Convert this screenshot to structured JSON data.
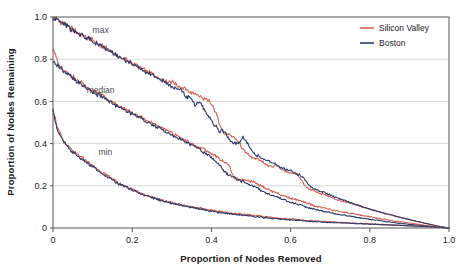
{
  "chart_data": {
    "type": "line",
    "title": "",
    "subtitle": "",
    "xlabel": "Proportion of Nodes Removed",
    "ylabel": "Proportion of Nodes Remaining",
    "xlim": [
      0,
      1
    ],
    "ylim": [
      0,
      1
    ],
    "grid": "horizontal",
    "xticks": [
      "0",
      "0.2",
      "0.4",
      "0.6",
      "0.8",
      "1.0"
    ],
    "xtick_values": [
      0,
      0.2,
      0.4,
      0.6,
      0.8,
      1
    ],
    "yticks": [
      "0",
      "0.2",
      "0.4",
      "0.6",
      "0.8",
      "1.0"
    ],
    "ytick_values": [
      0,
      0.2,
      0.4,
      0.6,
      0.8,
      1
    ],
    "legend_position": "top-right",
    "legend": [
      {
        "name": "Silicon Valley",
        "color": "#d5604e"
      },
      {
        "name": "Boston",
        "color": "#2c3b6b"
      }
    ],
    "annotations": [
      {
        "text": "max",
        "x": 0.1,
        "y": 0.925
      },
      {
        "text": "median",
        "x": 0.085,
        "y": 0.64
      },
      {
        "text": "min",
        "x": 0.115,
        "y": 0.345
      }
    ],
    "series": [
      {
        "name": "Silicon Valley max",
        "group": "max",
        "color": "#d5604e",
        "x": [
          0,
          0.012,
          0.024,
          0.036,
          0.048,
          0.06,
          0.072,
          0.084,
          0.096,
          0.108,
          0.12,
          0.132,
          0.144,
          0.156,
          0.168,
          0.18,
          0.192,
          0.204,
          0.216,
          0.228,
          0.24,
          0.252,
          0.264,
          0.276,
          0.288,
          0.3,
          0.312,
          0.324,
          0.336,
          0.348,
          0.36,
          0.372,
          0.384,
          0.396,
          0.408,
          0.42,
          0.432,
          0.444,
          0.456,
          0.468,
          0.48,
          0.492,
          0.504,
          0.516,
          0.528,
          0.54,
          0.552,
          0.564,
          0.576,
          0.588,
          0.6,
          0.612,
          0.624,
          0.636,
          0.648,
          0.66,
          0.672,
          0.684,
          0.696,
          0.708,
          0.72,
          0.732,
          0.744,
          0.756,
          0.768,
          0.78,
          0.792,
          0.804,
          0.816,
          0.828,
          0.84,
          0.852,
          0.864,
          0.876,
          0.888,
          0.9,
          0.912,
          0.924,
          0.936,
          0.948,
          0.96,
          0.972,
          0.984,
          1
        ],
        "y": [
          1,
          0.985,
          0.972,
          0.958,
          0.944,
          0.931,
          0.918,
          0.903,
          0.892,
          0.878,
          0.864,
          0.851,
          0.838,
          0.826,
          0.811,
          0.8,
          0.788,
          0.775,
          0.762,
          0.75,
          0.74,
          0.728,
          0.716,
          0.704,
          0.69,
          0.695,
          0.676,
          0.667,
          0.655,
          0.64,
          0.64,
          0.622,
          0.61,
          0.6,
          0.56,
          0.5,
          0.45,
          0.44,
          0.43,
          0.41,
          0.37,
          0.35,
          0.335,
          0.33,
          0.315,
          0.3,
          0.29,
          0.3,
          0.28,
          0.27,
          0.26,
          0.26,
          0.24,
          0.2,
          0.185,
          0.175,
          0.165,
          0.16,
          0.15,
          0.14,
          0.133,
          0.126,
          0.12,
          0.115,
          0.108,
          0.1,
          0.093,
          0.087,
          0.08,
          0.074,
          0.068,
          0.062,
          0.056,
          0.05,
          0.045,
          0.04,
          0.034,
          0.029,
          0.024,
          0.019,
          0.014,
          0.009,
          0.005,
          0
        ]
      },
      {
        "name": "Boston max",
        "group": "max",
        "color": "#2c3b6b",
        "x": [
          0,
          0.012,
          0.024,
          0.036,
          0.048,
          0.06,
          0.072,
          0.084,
          0.096,
          0.108,
          0.12,
          0.132,
          0.144,
          0.156,
          0.168,
          0.18,
          0.192,
          0.204,
          0.216,
          0.228,
          0.24,
          0.252,
          0.264,
          0.276,
          0.288,
          0.3,
          0.312,
          0.324,
          0.336,
          0.348,
          0.36,
          0.372,
          0.384,
          0.396,
          0.408,
          0.42,
          0.432,
          0.444,
          0.456,
          0.468,
          0.48,
          0.492,
          0.504,
          0.516,
          0.528,
          0.54,
          0.552,
          0.564,
          0.576,
          0.588,
          0.6,
          0.612,
          0.624,
          0.636,
          0.648,
          0.66,
          0.672,
          0.684,
          0.696,
          0.708,
          0.72,
          0.732,
          0.744,
          0.756,
          0.768,
          0.78,
          0.792,
          0.804,
          0.816,
          0.828,
          0.84,
          0.852,
          0.864,
          0.876,
          0.888,
          0.9,
          0.912,
          0.924,
          0.936,
          0.948,
          0.96,
          0.972,
          0.984,
          1
        ],
        "y": [
          0.995,
          0.982,
          0.969,
          0.955,
          0.942,
          0.928,
          0.915,
          0.9,
          0.888,
          0.875,
          0.861,
          0.848,
          0.835,
          0.823,
          0.808,
          0.797,
          0.785,
          0.772,
          0.76,
          0.747,
          0.736,
          0.724,
          0.712,
          0.7,
          0.686,
          0.67,
          0.66,
          0.655,
          0.62,
          0.615,
          0.58,
          0.6,
          0.555,
          0.52,
          0.49,
          0.46,
          0.46,
          0.42,
          0.4,
          0.4,
          0.43,
          0.4,
          0.36,
          0.345,
          0.33,
          0.32,
          0.31,
          0.3,
          0.285,
          0.275,
          0.27,
          0.255,
          0.25,
          0.23,
          0.2,
          0.185,
          0.175,
          0.17,
          0.16,
          0.15,
          0.14,
          0.132,
          0.125,
          0.118,
          0.11,
          0.102,
          0.095,
          0.088,
          0.081,
          0.075,
          0.069,
          0.063,
          0.057,
          0.051,
          0.046,
          0.04,
          0.035,
          0.03,
          0.024,
          0.019,
          0.014,
          0.009,
          0.005,
          0
        ]
      },
      {
        "name": "Silicon Valley median",
        "group": "median",
        "color": "#d5604e",
        "x": [
          0,
          0.012,
          0.024,
          0.036,
          0.048,
          0.06,
          0.072,
          0.084,
          0.096,
          0.108,
          0.12,
          0.132,
          0.144,
          0.156,
          0.168,
          0.18,
          0.192,
          0.204,
          0.216,
          0.228,
          0.24,
          0.252,
          0.264,
          0.276,
          0.288,
          0.3,
          0.312,
          0.324,
          0.336,
          0.348,
          0.36,
          0.372,
          0.384,
          0.396,
          0.408,
          0.42,
          0.432,
          0.444,
          0.456,
          0.468,
          0.48,
          0.492,
          0.504,
          0.516,
          0.528,
          0.54,
          0.552,
          0.564,
          0.576,
          0.588,
          0.6,
          0.612,
          0.624,
          0.636,
          0.648,
          0.66,
          0.672,
          0.684,
          0.696,
          0.708,
          0.72,
          0.732,
          0.744,
          0.756,
          0.768,
          0.78,
          0.792,
          0.804,
          0.816,
          0.828,
          0.84,
          0.852,
          0.864,
          0.876,
          0.888,
          0.9,
          0.912,
          0.924,
          0.936,
          0.948,
          0.96,
          0.972,
          0.984,
          1
        ],
        "y": [
          0.855,
          0.78,
          0.755,
          0.74,
          0.718,
          0.7,
          0.69,
          0.672,
          0.655,
          0.645,
          0.63,
          0.62,
          0.6,
          0.59,
          0.575,
          0.565,
          0.552,
          0.54,
          0.532,
          0.52,
          0.505,
          0.495,
          0.48,
          0.47,
          0.46,
          0.45,
          0.44,
          0.425,
          0.415,
          0.4,
          0.39,
          0.38,
          0.37,
          0.355,
          0.345,
          0.33,
          0.315,
          0.3,
          0.24,
          0.23,
          0.23,
          0.225,
          0.22,
          0.21,
          0.2,
          0.185,
          0.175,
          0.17,
          0.155,
          0.15,
          0.14,
          0.135,
          0.13,
          0.12,
          0.115,
          0.105,
          0.1,
          0.095,
          0.09,
          0.085,
          0.08,
          0.075,
          0.072,
          0.068,
          0.064,
          0.06,
          0.056,
          0.052,
          0.048,
          0.044,
          0.04,
          0.036,
          0.033,
          0.03,
          0.027,
          0.024,
          0.02,
          0.017,
          0.014,
          0.011,
          0.008,
          0.005,
          0.003,
          0
        ]
      },
      {
        "name": "Boston median",
        "group": "median",
        "color": "#2c3b6b",
        "x": [
          0,
          0.012,
          0.024,
          0.036,
          0.048,
          0.06,
          0.072,
          0.084,
          0.096,
          0.108,
          0.12,
          0.132,
          0.144,
          0.156,
          0.168,
          0.18,
          0.192,
          0.204,
          0.216,
          0.228,
          0.24,
          0.252,
          0.264,
          0.276,
          0.288,
          0.3,
          0.312,
          0.324,
          0.336,
          0.348,
          0.36,
          0.372,
          0.384,
          0.396,
          0.408,
          0.42,
          0.432,
          0.444,
          0.456,
          0.468,
          0.48,
          0.492,
          0.504,
          0.516,
          0.528,
          0.54,
          0.552,
          0.564,
          0.576,
          0.588,
          0.6,
          0.612,
          0.624,
          0.636,
          0.648,
          0.66,
          0.672,
          0.684,
          0.696,
          0.708,
          0.72,
          0.732,
          0.744,
          0.756,
          0.768,
          0.78,
          0.792,
          0.804,
          0.816,
          0.828,
          0.84,
          0.852,
          0.864,
          0.876,
          0.888,
          0.9,
          0.912,
          0.924,
          0.936,
          0.948,
          0.96,
          0.972,
          0.984,
          1
        ],
        "y": [
          0.79,
          0.77,
          0.75,
          0.73,
          0.712,
          0.695,
          0.68,
          0.665,
          0.65,
          0.638,
          0.625,
          0.612,
          0.598,
          0.585,
          0.572,
          0.56,
          0.548,
          0.538,
          0.525,
          0.512,
          0.5,
          0.49,
          0.478,
          0.465,
          0.452,
          0.44,
          0.43,
          0.42,
          0.405,
          0.395,
          0.385,
          0.37,
          0.355,
          0.34,
          0.32,
          0.3,
          0.27,
          0.25,
          0.24,
          0.225,
          0.22,
          0.21,
          0.2,
          0.19,
          0.175,
          0.165,
          0.155,
          0.15,
          0.14,
          0.13,
          0.12,
          0.115,
          0.11,
          0.1,
          0.095,
          0.09,
          0.085,
          0.08,
          0.075,
          0.07,
          0.066,
          0.062,
          0.058,
          0.054,
          0.05,
          0.047,
          0.044,
          0.04,
          0.037,
          0.034,
          0.031,
          0.028,
          0.025,
          0.022,
          0.02,
          0.017,
          0.015,
          0.013,
          0.01,
          0.008,
          0.006,
          0.004,
          0.002,
          0
        ]
      },
      {
        "name": "Silicon Valley min",
        "group": "min",
        "color": "#d5604e",
        "x": [
          0,
          0.012,
          0.024,
          0.036,
          0.048,
          0.06,
          0.072,
          0.084,
          0.096,
          0.108,
          0.12,
          0.132,
          0.144,
          0.156,
          0.168,
          0.18,
          0.192,
          0.204,
          0.216,
          0.228,
          0.24,
          0.252,
          0.264,
          0.276,
          0.288,
          0.3,
          0.312,
          0.324,
          0.336,
          0.348,
          0.36,
          0.372,
          0.384,
          0.396,
          0.408,
          0.42,
          0.432,
          0.444,
          0.456,
          0.468,
          0.48,
          0.492,
          0.504,
          0.516,
          0.528,
          0.54,
          0.552,
          0.564,
          0.576,
          0.588,
          0.6,
          0.612,
          0.624,
          0.636,
          0.648,
          0.66,
          0.672,
          0.684,
          0.696,
          0.708,
          0.72,
          0.732,
          0.744,
          0.756,
          0.768,
          0.78,
          0.792,
          0.804,
          0.816,
          0.828,
          0.84,
          0.852,
          0.864,
          0.876,
          0.888,
          0.9,
          0.912,
          0.924,
          0.936,
          0.948,
          0.96,
          0.972,
          0.984,
          1
        ],
        "y": [
          0.565,
          0.47,
          0.42,
          0.39,
          0.37,
          0.35,
          0.335,
          0.32,
          0.3,
          0.285,
          0.27,
          0.255,
          0.24,
          0.225,
          0.21,
          0.2,
          0.19,
          0.18,
          0.17,
          0.16,
          0.152,
          0.145,
          0.14,
          0.132,
          0.125,
          0.12,
          0.115,
          0.11,
          0.105,
          0.1,
          0.098,
          0.094,
          0.09,
          0.086,
          0.082,
          0.078,
          0.075,
          0.072,
          0.07,
          0.068,
          0.065,
          0.063,
          0.06,
          0.058,
          0.055,
          0.053,
          0.05,
          0.048,
          0.046,
          0.044,
          0.042,
          0.04,
          0.039,
          0.037,
          0.036,
          0.034,
          0.033,
          0.031,
          0.03,
          0.029,
          0.027,
          0.026,
          0.025,
          0.024,
          0.022,
          0.021,
          0.02,
          0.019,
          0.018,
          0.017,
          0.016,
          0.015,
          0.014,
          0.013,
          0.012,
          0.011,
          0.01,
          0.009,
          0.008,
          0.006,
          0.005,
          0.004,
          0.002,
          0
        ]
      },
      {
        "name": "Boston min",
        "group": "min",
        "color": "#2c3b6b",
        "x": [
          0,
          0.012,
          0.024,
          0.036,
          0.048,
          0.06,
          0.072,
          0.084,
          0.096,
          0.108,
          0.12,
          0.132,
          0.144,
          0.156,
          0.168,
          0.18,
          0.192,
          0.204,
          0.216,
          0.228,
          0.24,
          0.252,
          0.264,
          0.276,
          0.288,
          0.3,
          0.312,
          0.324,
          0.336,
          0.348,
          0.36,
          0.372,
          0.384,
          0.396,
          0.408,
          0.42,
          0.432,
          0.444,
          0.456,
          0.468,
          0.48,
          0.492,
          0.504,
          0.516,
          0.528,
          0.54,
          0.552,
          0.564,
          0.576,
          0.588,
          0.6,
          0.612,
          0.624,
          0.636,
          0.648,
          0.66,
          0.672,
          0.684,
          0.696,
          0.708,
          0.72,
          0.732,
          0.744,
          0.756,
          0.768,
          0.78,
          0.792,
          0.804,
          0.816,
          0.828,
          0.84,
          0.852,
          0.864,
          0.876,
          0.888,
          0.9,
          0.912,
          0.924,
          0.936,
          0.948,
          0.96,
          0.972,
          0.984,
          1
        ],
        "y": [
          0.555,
          0.46,
          0.415,
          0.385,
          0.36,
          0.345,
          0.325,
          0.31,
          0.295,
          0.28,
          0.262,
          0.248,
          0.235,
          0.22,
          0.208,
          0.196,
          0.186,
          0.176,
          0.167,
          0.158,
          0.15,
          0.143,
          0.137,
          0.13,
          0.123,
          0.118,
          0.112,
          0.107,
          0.102,
          0.098,
          0.094,
          0.09,
          0.086,
          0.082,
          0.078,
          0.074,
          0.071,
          0.068,
          0.065,
          0.062,
          0.06,
          0.057,
          0.055,
          0.052,
          0.05,
          0.048,
          0.046,
          0.044,
          0.042,
          0.04,
          0.038,
          0.037,
          0.035,
          0.034,
          0.032,
          0.031,
          0.03,
          0.028,
          0.027,
          0.026,
          0.025,
          0.024,
          0.023,
          0.022,
          0.021,
          0.02,
          0.019,
          0.018,
          0.017,
          0.016,
          0.015,
          0.014,
          0.013,
          0.012,
          0.011,
          0.01,
          0.009,
          0.008,
          0.007,
          0.006,
          0.005,
          0.003,
          0.002,
          0
        ]
      }
    ]
  },
  "plot": {
    "bg": "#ffffff",
    "frame_color": "#58595b",
    "grid_color": "#d8d8d8",
    "axis_color": "#58595b"
  }
}
